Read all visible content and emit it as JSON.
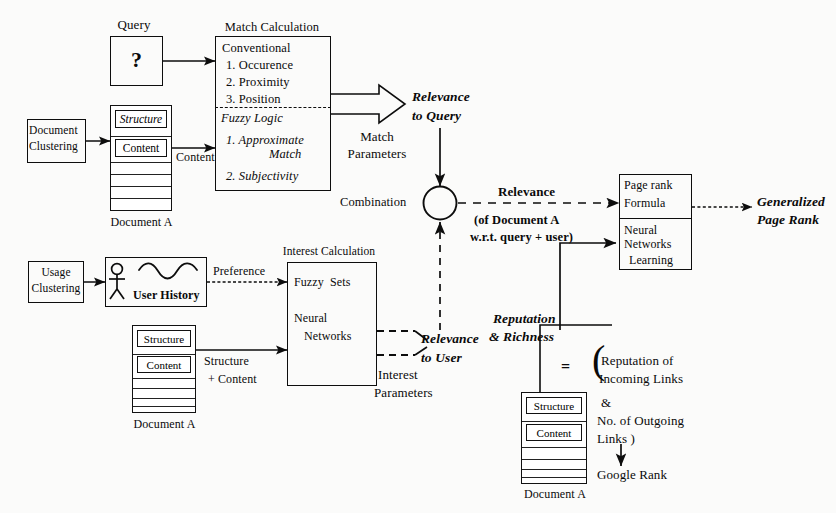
{
  "diagram": {
    "ink_color": "#0d0d0d",
    "background": "#fbfbfa"
  },
  "query": {
    "caption": "Query",
    "symbol": "?"
  },
  "match_calculation": {
    "caption": "Match Calculation",
    "conventional_heading": "Conventional",
    "conventional_items": [
      "1. Occurence",
      "2. Proximity",
      "3. Position"
    ],
    "fuzzy_heading": "Fuzzy Logic",
    "fuzzy_items": [
      "1. Approximate",
      "Match",
      "2. Subjectivity"
    ]
  },
  "document_clustering": {
    "line1": "Document",
    "line2": "Clustering"
  },
  "document_a_top": {
    "structure": "Structure",
    "content": "Content",
    "caption": "Document A"
  },
  "document_a_mid": {
    "structure": "Structure",
    "content": "Content",
    "caption": "Document A"
  },
  "document_a_bottom": {
    "structure": "Structure",
    "content": "Content",
    "caption": "Document A"
  },
  "edges": {
    "content": "Content",
    "structure_plus_content_l1": "Structure",
    "structure_plus_content_l2": "+ Content",
    "preference": "Preference"
  },
  "relevance_to_query": {
    "line1": "Relevance",
    "line2": "to Query",
    "params_l1": "Match",
    "params_l2": "Parameters"
  },
  "combination": {
    "label": "Combination"
  },
  "relevance_combined": {
    "title": "Relevance",
    "sub1": "(of Document A",
    "sub2": "w.r.t. query + user)"
  },
  "usage_clustering": {
    "line1": "Usage",
    "line2": "Clustering"
  },
  "user_history": {
    "label": "User History"
  },
  "interest_calculation": {
    "caption": "Interest Calculation",
    "item1": "Fuzzy  Sets",
    "item2_l1": "Neural",
    "item2_l2": "Networks"
  },
  "relevance_to_user": {
    "line1": "Relevance",
    "line2": "to User",
    "params_l1": "Interest",
    "params_l2": "Parameters"
  },
  "page_rank_box": {
    "top_l1": "Page rank",
    "top_l2": "Formula",
    "bottom_l1": "Neural",
    "bottom_l2": "Networks",
    "bottom_l3": "Learning"
  },
  "generalized_page_rank": {
    "line1": "Generalized",
    "line2": "Page Rank"
  },
  "reputation": {
    "title_l1": "Reputation",
    "title_l2": "& Richness",
    "equals": "=",
    "expr_l1": "Reputation of",
    "expr_l2": "Incoming Links",
    "expr_l3": "&",
    "expr_l4": "No. of Outgoing",
    "expr_l5": "Links )",
    "open_paren": "(",
    "result": "Google Rank"
  }
}
